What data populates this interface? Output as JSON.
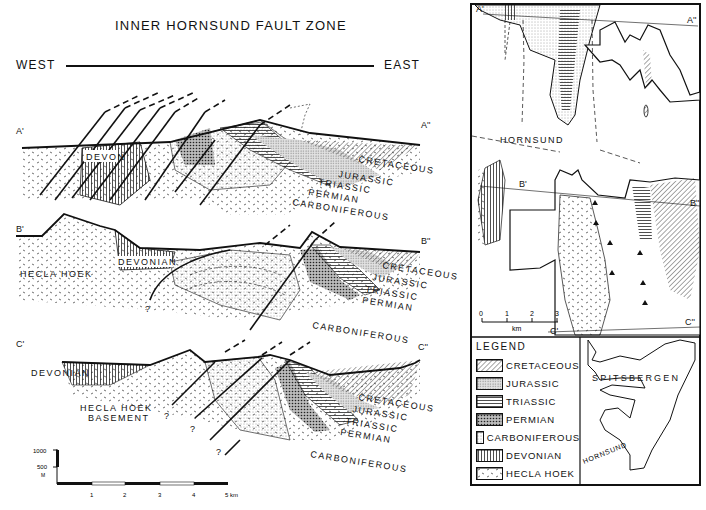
{
  "figure": {
    "title": "INNER HORNSUND FAULT ZONE",
    "west_label": "WEST",
    "east_label": "EAST"
  },
  "sections": [
    {
      "id": "A",
      "start_label": "A'",
      "end_label": "A''",
      "unit_labels": [
        "DEVON",
        "CRETACEOUS",
        "JURASSIC",
        "TRIASSIC",
        "PERMIAN",
        "CARBONIFEROUS"
      ]
    },
    {
      "id": "B",
      "start_label": "B'",
      "end_label": "B''",
      "unit_labels": [
        "HECLA HOEK",
        "DEVONIAN",
        "CRETACEOUS",
        "JURASSIC",
        "TRIASSIC",
        "PERMIAN",
        "CARBONIFEROUS"
      ],
      "uncertain_marker": "?"
    },
    {
      "id": "C",
      "start_label": "C'",
      "end_label": "C''",
      "unit_labels": [
        "DEVONIAN",
        "HECLA HOEK",
        "BASEMENT",
        "CRETACEOUS",
        "JURASSIC",
        "TRIASSIC",
        "PERMIAN",
        "CARBONIFEROUS"
      ],
      "uncertain_marker": "?"
    }
  ],
  "vertical_scale": {
    "ticks": [
      "1000",
      "500"
    ],
    "unit": "M"
  },
  "horizontal_scale": {
    "ticks": [
      "1",
      "2",
      "3",
      "4"
    ],
    "end_label": "5 km"
  },
  "map": {
    "place_label": "HORNSUND",
    "section_labels": [
      "A'",
      "A''",
      "B'",
      "B''",
      "C'",
      "C''"
    ],
    "scale_ticks": [
      "0",
      "1",
      "2",
      "3"
    ],
    "scale_unit": "km"
  },
  "legend": {
    "title": "LEGEND",
    "items": [
      {
        "label": "CRETACEOUS",
        "pattern": "diagonal-hatch"
      },
      {
        "label": "JURASSIC",
        "pattern": "dense-stipple"
      },
      {
        "label": "TRIASSIC",
        "pattern": "horizontal-lines"
      },
      {
        "label": "PERMIAN",
        "pattern": "coarse-dots"
      },
      {
        "label": "CARBONIFEROUS",
        "pattern": "fine-stipple"
      },
      {
        "label": "DEVONIAN",
        "pattern": "vertical-lines"
      },
      {
        "label": "HECLA HOEK",
        "pattern": "dashes"
      }
    ]
  },
  "inset": {
    "title": "SPITSBERGEN",
    "place_label": "HORNSUND"
  },
  "colors": {
    "ink": "#111111",
    "background": "#ffffff"
  }
}
